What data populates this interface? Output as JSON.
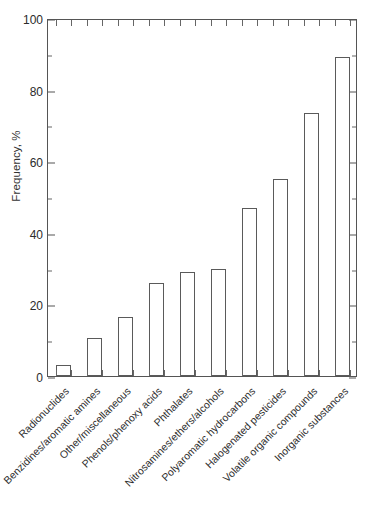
{
  "chart_data": {
    "type": "bar",
    "title": "",
    "xlabel": "",
    "ylabel": "Frequency, %",
    "ylim": [
      0,
      100
    ],
    "ytick_labels": [
      "0",
      "20",
      "40",
      "60",
      "80",
      "100"
    ],
    "ytick_values": [
      0,
      20,
      40,
      60,
      80,
      100
    ],
    "yminor_values": [
      10,
      30,
      50,
      70,
      90
    ],
    "grid": false,
    "legend": "none",
    "orientation": "vertical",
    "bar_style": {
      "fill": "#ffffff",
      "edge": "#5a5a5a"
    },
    "categories": [
      "Radionuclides",
      "Benzidines/aromatic amines",
      "Other/miscellaneous",
      "Phenols/phenoxy acids",
      "Phthalates",
      "Nitrosamines/ethers/alcohols",
      "Polyaromatic hydrocarbons",
      "Halogenated pesticides",
      "Volatile organic compounds",
      "Inorganic substances"
    ],
    "values": [
      3,
      10.5,
      16.5,
      26,
      29,
      30,
      47,
      55,
      73.5,
      89
    ]
  },
  "figure": {
    "caption": ""
  }
}
